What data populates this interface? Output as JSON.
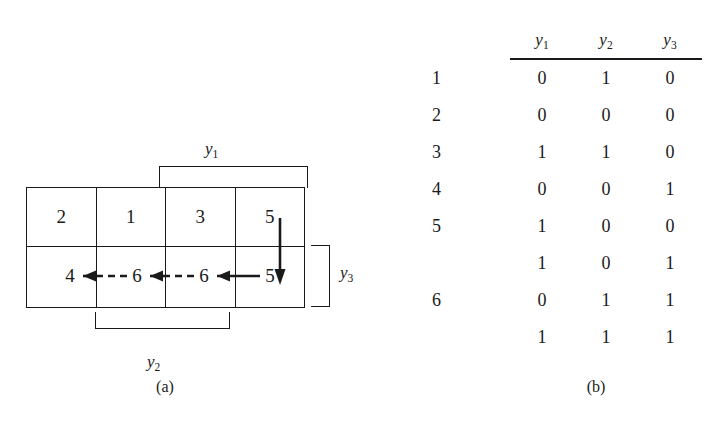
{
  "figure": {
    "caption_a": "(a)",
    "caption_b": "(b)"
  },
  "panel_a": {
    "grid": {
      "rows": 2,
      "cols": 4,
      "top_row_cells": [
        "2",
        "1",
        "3",
        "5"
      ],
      "bottom_row_cells": [
        "4",
        "6",
        "6",
        "5"
      ]
    },
    "arrows": [
      {
        "from": "6",
        "to": "4",
        "direction": "left",
        "style": "dashed"
      },
      {
        "from": "6",
        "to": "6",
        "direction": "left",
        "style": "dashed"
      },
      {
        "from": "5",
        "to": "6",
        "direction": "left",
        "style": "solid"
      },
      {
        "from": "cell-5-top",
        "to": "cell-5-bottom",
        "direction": "down",
        "style": "solid"
      }
    ],
    "brackets": [
      {
        "label": "y",
        "subscript": "1",
        "position": "top",
        "spans_cols": [
          3,
          4
        ]
      },
      {
        "label": "y",
        "subscript": "2",
        "position": "bottom",
        "spans_cols": [
          2,
          3
        ]
      },
      {
        "label": "y",
        "subscript": "3",
        "position": "right",
        "spans_rows": [
          2
        ]
      }
    ],
    "label_y1_base": "y",
    "label_y1_sub": "1",
    "label_y2_base": "y",
    "label_y2_sub": "2",
    "label_y3_base": "y",
    "label_y3_sub": "3"
  },
  "panel_b": {
    "headers": [
      {
        "base": "y",
        "sub": "1"
      },
      {
        "base": "y",
        "sub": "2"
      },
      {
        "base": "y",
        "sub": "3"
      }
    ],
    "header_y1_base": "y",
    "header_y1_sub": "1",
    "header_y2_base": "y",
    "header_y2_sub": "2",
    "header_y3_base": "y",
    "header_y3_sub": "3",
    "rows": [
      {
        "label": "1",
        "values": [
          "0",
          "1",
          "0"
        ]
      },
      {
        "label": "2",
        "values": [
          "0",
          "0",
          "0"
        ]
      },
      {
        "label": "3",
        "values": [
          "1",
          "1",
          "0"
        ]
      },
      {
        "label": "4",
        "values": [
          "0",
          "0",
          "1"
        ]
      },
      {
        "label": "5",
        "values": [
          "1",
          "0",
          "0"
        ]
      },
      {
        "label": "",
        "values": [
          "1",
          "0",
          "1"
        ]
      },
      {
        "label": "6",
        "values": [
          "0",
          "1",
          "1"
        ]
      },
      {
        "label": "",
        "values": [
          "1",
          "1",
          "1"
        ]
      }
    ]
  },
  "colors": {
    "ink": "#1a1a1a",
    "background": "#ffffff"
  }
}
